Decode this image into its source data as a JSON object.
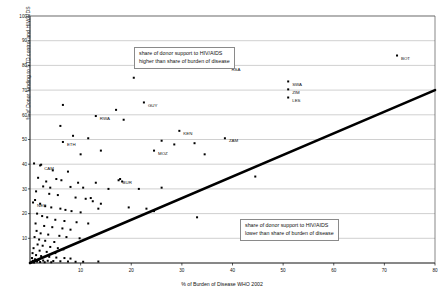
{
  "chart_data": {
    "type": "scatter",
    "title": "",
    "xlabel": "% of Burden of Disease WHO 2002",
    "ylabel": "% of Donor funding to STD control and HIV/AIDS",
    "xlim": [
      0,
      80
    ],
    "ylim": [
      0,
      100
    ],
    "xticks": [
      10,
      20,
      30,
      40,
      50,
      60,
      70,
      80
    ],
    "yticks": [
      10,
      20,
      30,
      40,
      50,
      60,
      70,
      80,
      90,
      100
    ],
    "grid": "horizontal",
    "legend": "none",
    "reference_line": {
      "name": "equal-share-line",
      "from": [
        0,
        0
      ],
      "to": [
        80,
        70
      ],
      "style": "thick-black"
    },
    "annotations": [
      {
        "name": "above-line-note",
        "lines": [
          "share of donor support to HIV/AIDS",
          "higher than share of burden of disease"
        ]
      },
      {
        "name": "below-line-note",
        "lines": [
          "share of donor support to HIV/AIDS",
          "lower than share of burden of disease"
        ]
      }
    ],
    "labeled_points": [
      {
        "label": "BOT",
        "x": 72.5,
        "y": 84.0
      },
      {
        "label": "RSA",
        "x": 39.0,
        "y": 79.5
      },
      {
        "label": "SWA",
        "x": 51.0,
        "y": 73.5
      },
      {
        "label": "ZIM",
        "x": 51.0,
        "y": 70.3
      },
      {
        "label": "LES",
        "x": 51.0,
        "y": 67.0
      },
      {
        "label": "GUY",
        "x": 22.5,
        "y": 65.0
      },
      {
        "label": "RWA",
        "x": 13.0,
        "y": 59.5
      },
      {
        "label": "KEN",
        "x": 29.5,
        "y": 53.5
      },
      {
        "label": "ZAM",
        "x": 38.5,
        "y": 50.5
      },
      {
        "label": "ETH",
        "x": 6.5,
        "y": 49.0
      },
      {
        "label": "MOZ",
        "x": 24.5,
        "y": 45.5
      },
      {
        "label": "CAM",
        "x": 2.0,
        "y": 39.5
      },
      {
        "label": "BUR",
        "x": 17.5,
        "y": 33.5
      },
      {
        "label": "NEP",
        "x": 0.6,
        "y": 24.5
      }
    ],
    "unlabeled_points": [
      [
        20.5,
        75.0
      ],
      [
        6.5,
        64.0
      ],
      [
        17.0,
        62.0
      ],
      [
        18.5,
        58.0
      ],
      [
        6.0,
        55.5
      ],
      [
        8.5,
        51.5
      ],
      [
        11.5,
        50.5
      ],
      [
        26.0,
        49.5
      ],
      [
        28.5,
        48.0
      ],
      [
        32.5,
        48.5
      ],
      [
        14.0,
        45.5
      ],
      [
        10.0,
        44.0
      ],
      [
        34.5,
        44.0
      ],
      [
        0.8,
        40.3
      ],
      [
        2.2,
        39.8
      ],
      [
        4.5,
        37.5
      ],
      [
        7.5,
        37.0
      ],
      [
        44.5,
        35.0
      ],
      [
        1.6,
        34.5
      ],
      [
        3.2,
        33.0
      ],
      [
        5.2,
        34.0
      ],
      [
        6.2,
        33.5
      ],
      [
        9.5,
        32.5
      ],
      [
        13.0,
        32.5
      ],
      [
        17.8,
        34.0
      ],
      [
        18.2,
        33.0
      ],
      [
        2.6,
        31.0
      ],
      [
        4.0,
        30.5
      ],
      [
        8.0,
        30.8
      ],
      [
        10.5,
        30.5
      ],
      [
        15.5,
        30.0
      ],
      [
        21.5,
        30.0
      ],
      [
        26.0,
        30.5
      ],
      [
        1.2,
        29.0
      ],
      [
        3.8,
        28.0
      ],
      [
        5.5,
        27.5
      ],
      [
        9.0,
        26.5
      ],
      [
        11.0,
        26.0
      ],
      [
        12.0,
        26.3
      ],
      [
        12.4,
        25.0
      ],
      [
        14.0,
        24.0
      ],
      [
        1.0,
        25.5
      ],
      [
        2.0,
        24.0
      ],
      [
        3.0,
        23.0
      ],
      [
        4.2,
        22.5
      ],
      [
        6.0,
        22.0
      ],
      [
        7.0,
        21.5
      ],
      [
        8.2,
        21.0
      ],
      [
        10.0,
        20.5
      ],
      [
        13.5,
        22.0
      ],
      [
        19.5,
        22.5
      ],
      [
        23.0,
        22.0
      ],
      [
        24.5,
        21.0
      ],
      [
        33.0,
        18.5
      ],
      [
        1.4,
        20.0
      ],
      [
        2.4,
        19.0
      ],
      [
        3.4,
        18.5
      ],
      [
        5.0,
        17.5
      ],
      [
        6.8,
        17.0
      ],
      [
        9.2,
        16.5
      ],
      [
        11.5,
        16.0
      ],
      [
        1.1,
        16.0
      ],
      [
        2.8,
        15.0
      ],
      [
        4.4,
        14.5
      ],
      [
        6.4,
        14.0
      ],
      [
        8.0,
        13.5
      ],
      [
        1.3,
        13.0
      ],
      [
        2.1,
        12.0
      ],
      [
        3.6,
        11.5
      ],
      [
        5.8,
        11.0
      ],
      [
        7.2,
        10.5
      ],
      [
        9.8,
        10.0
      ],
      [
        0.9,
        10.5
      ],
      [
        1.8,
        9.5
      ],
      [
        3.0,
        9.0
      ],
      [
        4.8,
        8.5
      ],
      [
        1.5,
        7.5
      ],
      [
        2.5,
        7.0
      ],
      [
        4.0,
        6.5
      ],
      [
        5.5,
        6.0
      ],
      [
        6.6,
        5.5
      ],
      [
        0.7,
        6.0
      ],
      [
        1.9,
        5.0
      ],
      [
        3.3,
        4.5
      ],
      [
        5.0,
        4.0
      ],
      [
        0.5,
        4.0
      ],
      [
        1.2,
        3.2
      ],
      [
        2.2,
        2.8
      ],
      [
        3.8,
        2.5
      ],
      [
        5.2,
        2.2
      ],
      [
        6.8,
        2.0
      ],
      [
        8.0,
        1.8
      ],
      [
        0.4,
        2.0
      ],
      [
        1.0,
        1.5
      ],
      [
        1.7,
        1.2
      ],
      [
        2.6,
        1.0
      ],
      [
        3.5,
        0.9
      ],
      [
        4.6,
        0.8
      ],
      [
        6.0,
        0.7
      ],
      [
        7.5,
        0.6
      ],
      [
        9.0,
        0.5
      ],
      [
        10.5,
        0.5
      ],
      [
        13.5,
        0.6
      ],
      [
        0.6,
        0.9
      ],
      [
        1.4,
        0.6
      ],
      [
        2.0,
        0.4
      ],
      [
        2.9,
        0.3
      ],
      [
        4.2,
        0.3
      ],
      [
        0.3,
        0.5
      ],
      [
        0.8,
        0.2
      ]
    ]
  }
}
